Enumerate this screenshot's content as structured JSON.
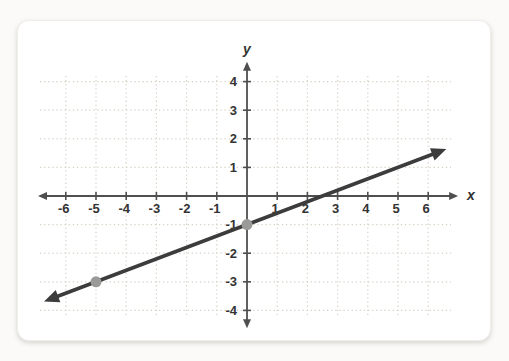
{
  "page": {
    "background": "#fbfaf8",
    "card_background": "#ffffff"
  },
  "chart_data": {
    "type": "line",
    "title": "",
    "xlabel": "x",
    "ylabel": "y",
    "x_ticks": [
      -6,
      -5,
      -4,
      -3,
      -2,
      -1,
      1,
      2,
      3,
      4,
      5,
      6
    ],
    "y_ticks": [
      -4,
      -3,
      -2,
      -1,
      1,
      2,
      3,
      4
    ],
    "xlim": [
      -6.92,
      6.99
    ],
    "ylim": [
      -4.62,
      4.69
    ],
    "grid": "dotted",
    "legend": "none",
    "series": [
      {
        "name": "line",
        "slope": 0.4,
        "y_intercept": -1,
        "x_start": -6.72,
        "x_end": 6.6,
        "arrow_both_ends": true
      }
    ],
    "marked_points": [
      {
        "x": -5,
        "y": -3
      },
      {
        "x": 0,
        "y": -1
      }
    ],
    "colors": {
      "axis": "#4f4f4f",
      "line": "#3c3c3c",
      "point": "#9a9a98",
      "grid": "#d8d2c6",
      "label": "#333333"
    }
  }
}
